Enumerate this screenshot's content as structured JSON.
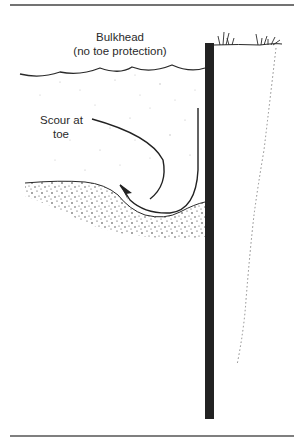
{
  "diagram": {
    "title_line1": "Bulkhead",
    "title_line2": "(no toe protection)",
    "annotation_line1": "Scour at",
    "annotation_line2": "toe",
    "elements": [
      "top-rule",
      "water-surface",
      "bulkhead-wall",
      "ground-surface-with-grass",
      "scour-flow-arrow",
      "sediment-bed",
      "backfill-soil-boundary",
      "bottom-rule"
    ],
    "colors": {
      "ink": "#2a2a2a",
      "bulkhead": "#222222",
      "background": "#ffffff"
    }
  }
}
